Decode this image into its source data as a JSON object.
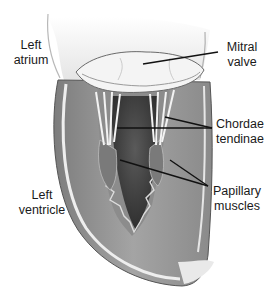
{
  "diagram": {
    "colors": {
      "background": "#ffffff",
      "wall": "#9a9a9a",
      "wall_dark": "#6e6e6e",
      "cavity": "#4a4a4a",
      "tissue_light": "#e8e8e8",
      "leader_line": "#111111",
      "text": "#1a1a1a"
    },
    "labels": [
      {
        "id": "left-atrium",
        "lines": [
          "Left",
          "atrium"
        ]
      },
      {
        "id": "mitral-valve",
        "lines": [
          "Mitral",
          "valve"
        ]
      },
      {
        "id": "chordae-tendinae",
        "lines": [
          "Chordae",
          "tendinae"
        ]
      },
      {
        "id": "left-ventricle",
        "lines": [
          "Left",
          "ventricle"
        ]
      },
      {
        "id": "papillary-muscles",
        "lines": [
          "Papillary",
          "muscles"
        ]
      }
    ]
  }
}
